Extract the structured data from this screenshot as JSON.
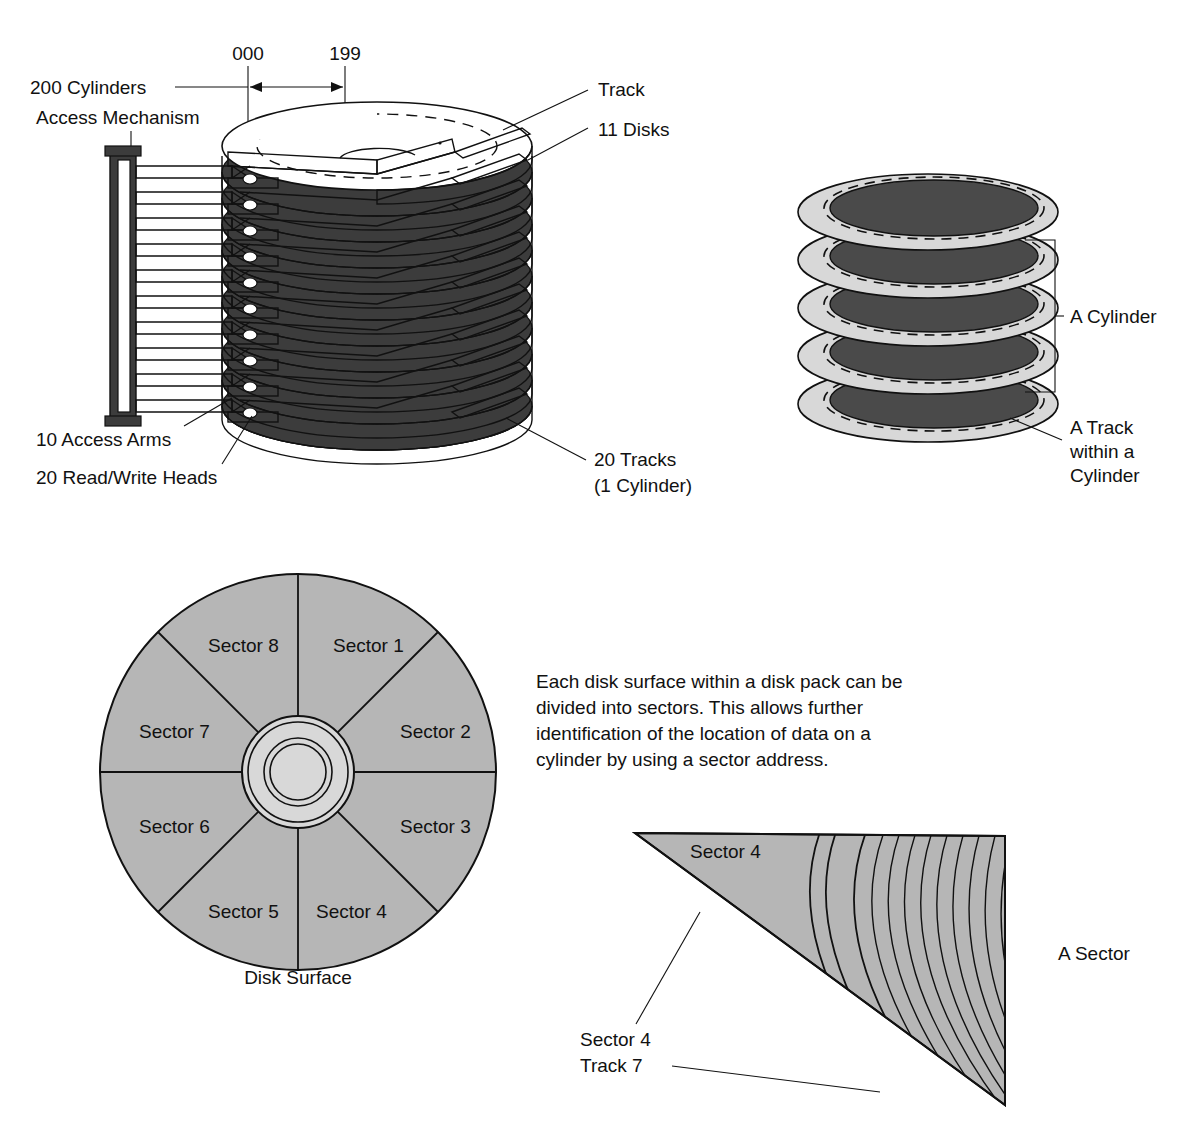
{
  "figure": {
    "background": "#ffffff",
    "ink": "#111111"
  },
  "colors": {
    "ink": "#111111",
    "dark_platter": "#3c3c3c",
    "mid_gray": "#b6b6b6",
    "light_gray": "#d8d8d8",
    "white": "#ffffff"
  },
  "diagram_data": {
    "type": "diagram",
    "panels": [
      {
        "id": "disk-pack",
        "name": "Disk pack with access mechanism",
        "facts": {
          "cylinders": 200,
          "cylinder_low_address": "000",
          "cylinder_high_address": "199",
          "disks": 11,
          "access_arms": 10,
          "read_write_heads": 20,
          "tracks_per_cylinder": 20
        }
      },
      {
        "id": "cylinder-detail",
        "name": "A cylinder formed by aligned tracks",
        "facts": {
          "platters_shown": 5
        }
      },
      {
        "id": "disk-surface",
        "name": "Disk surface divided into 8 sectors",
        "facts": {
          "sectors": 8
        }
      },
      {
        "id": "sector-wedge",
        "name": "Single sector showing tracks",
        "facts": {
          "highlighted_sector": 4,
          "highlighted_track": 7
        }
      }
    ]
  },
  "disk_pack": {
    "cylinder_low": "000",
    "cylinder_high": "199",
    "label_cylinders": "200 Cylinders",
    "label_access_mechanism": "Access Mechanism",
    "label_track": "Track",
    "label_disks": "11 Disks",
    "label_access_arms": "10 Access Arms",
    "label_heads": "20 Read/Write Heads",
    "label_tracks_line1": "20 Tracks",
    "label_tracks_line2": "(1 Cylinder)"
  },
  "cylinder_detail": {
    "label_cylinder": "A Cylinder",
    "label_track_line1": "A Track",
    "label_track_line2": "within a",
    "label_track_line3": "Cylinder"
  },
  "disk_surface": {
    "caption": "Disk Surface",
    "sectors": [
      "Sector 1",
      "Sector 2",
      "Sector 3",
      "Sector 4",
      "Sector 5",
      "Sector 6",
      "Sector 7",
      "Sector 8"
    ]
  },
  "explanation": {
    "line1": "Each disk surface within a disk pack can be",
    "line2": "divided into sectors. This allows further",
    "line3": "identification of the location of data on a",
    "line4": "cylinder by using a sector address."
  },
  "sector_wedge": {
    "label_inside": "Sector 4",
    "label_a_sector": "A Sector",
    "callout_line1": "Sector 4",
    "callout_line2": "Track 7"
  }
}
